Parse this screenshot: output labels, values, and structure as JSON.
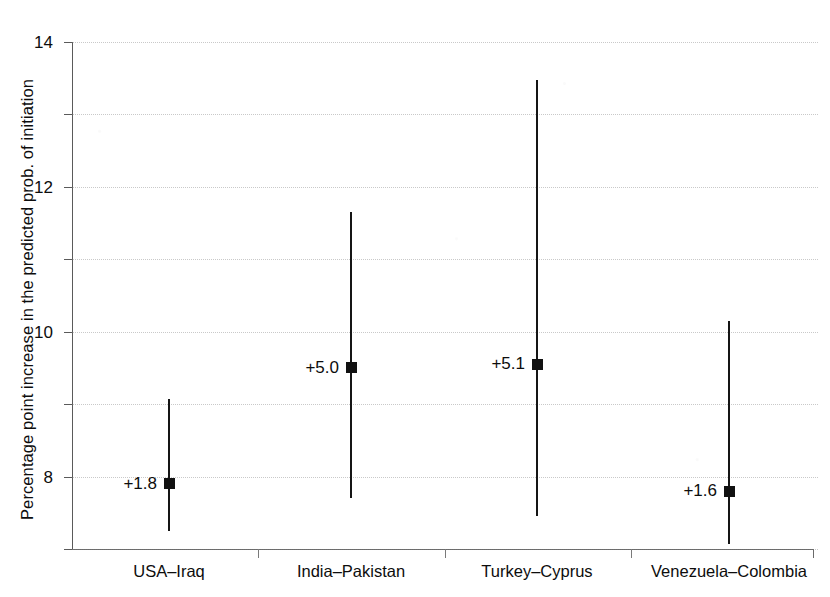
{
  "chart_data": {
    "type": "scatter",
    "title": "",
    "subtitle": "",
    "xlabel": "",
    "ylabel": "Percentage point increase in the predicted prob. of initiation",
    "categories": [
      "USA–Iraq",
      "India–Pakistan",
      "Turkey–Cyprus",
      "Venezuela–Colombia"
    ],
    "values": [
      1.8,
      5.0,
      5.1,
      1.6
    ],
    "point_labels": [
      "+1.8",
      "+5.0",
      "+5.1",
      "+1.6"
    ],
    "error_low": [
      0.5,
      1.4,
      0.9,
      0.15
    ],
    "error_high": [
      4.15,
      9.3,
      12.95,
      6.3
    ],
    "series": [
      {
        "name": "Predicted probability increase",
        "points": [
          {
            "category": "USA–Iraq",
            "value": 1.8,
            "label": "+1.8",
            "ci_low": 0.5,
            "ci_high": 4.15
          },
          {
            "category": "India–Pakistan",
            "value": 5.0,
            "label": "+5.0",
            "ci_low": 1.4,
            "ci_high": 9.3
          },
          {
            "category": "Turkey–Cyprus",
            "value": 5.1,
            "label": "+5.1",
            "ci_low": 0.9,
            "ci_high": 12.95
          },
          {
            "category": "Venezuela–Colombia",
            "value": 1.6,
            "label": "+1.6",
            "ci_low": 0.15,
            "ci_high": 6.3
          }
        ]
      }
    ],
    "ylim": [
      0,
      14
    ],
    "yticks": [
      0,
      2,
      4,
      6,
      8,
      10,
      12,
      14
    ],
    "ytick_labels": [
      "0",
      "2",
      "4",
      "6",
      "8",
      "10",
      "12",
      "14"
    ],
    "grid": true,
    "grid_axis": "y",
    "legend": "none",
    "legend_position": "none",
    "marker_style": "square",
    "colors": {
      "marker": "#111111",
      "whisker": "#151515",
      "axis": "#5a5a5a",
      "grid": "#8a8a8a",
      "text": "#0d0d0d",
      "background": "#ffffff"
    }
  }
}
